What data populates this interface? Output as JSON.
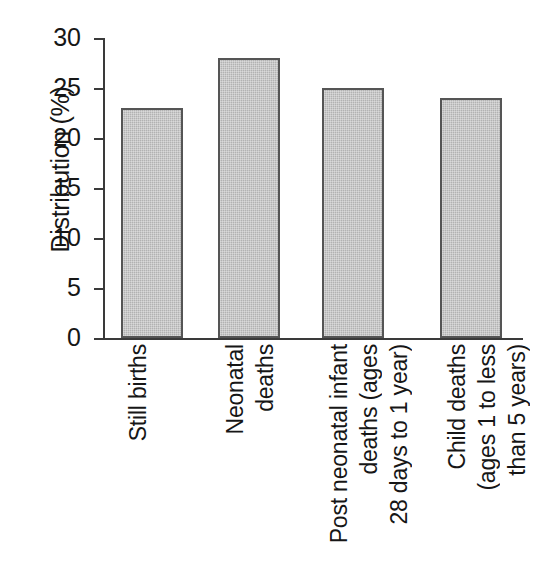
{
  "chart_data": {
    "type": "bar",
    "title": "",
    "xlabel": "",
    "ylabel": "Distribution (%)",
    "categories": [
      "Still births",
      "Neonatal deaths",
      "Post neonatal infant deaths (ages 28 days to 1 year)",
      "Child deaths (ages 1 to less than 5 years)"
    ],
    "category_lines": [
      [
        "Still births"
      ],
      [
        "Neonatal",
        "deaths"
      ],
      [
        "Post neonatal infant",
        "deaths (ages",
        "28 days to 1 year)"
      ],
      [
        "Child deaths",
        "(ages 1 to less",
        "than 5 years)"
      ]
    ],
    "values": [
      23,
      28,
      25,
      24
    ],
    "ylim": [
      0,
      30
    ],
    "yticks": [
      0,
      5,
      10,
      15,
      20,
      25,
      30
    ],
    "ytick_labels": [
      "0",
      "5",
      "10",
      "15",
      "20",
      "25",
      "30"
    ],
    "grid": false,
    "legend": false,
    "bar_fill_color": "#b2b2b2",
    "bar_border_color": "#555555",
    "axis_color": "#3a3a3a",
    "text_color": "#161616",
    "background_color": "#ffffff"
  }
}
